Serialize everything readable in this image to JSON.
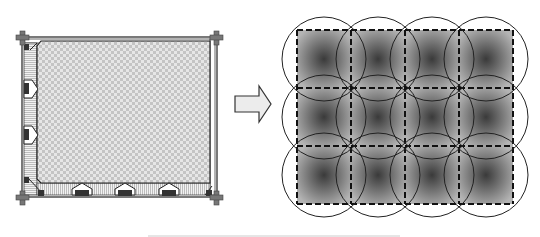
{
  "figure": {
    "left_panel": {
      "label": "room-floor-plan",
      "frame": {
        "x": 22,
        "y": 37,
        "w": 195,
        "h": 160
      },
      "floor_area": {
        "x": 37,
        "y": 41,
        "w": 176,
        "h": 142
      },
      "left_wall_windows": 2,
      "bottom_wall_windows": 3,
      "corner_posts": 4
    },
    "arrow": {
      "direction": "right",
      "x": 235,
      "y": 85,
      "w": 36,
      "h": 38
    },
    "right_panel": {
      "label": "coverage-grid",
      "grid": {
        "x": 297,
        "y": 30,
        "cols": 4,
        "rows": 3,
        "cell_w": 54,
        "cell_h": 58
      },
      "circle_radius": 42,
      "cell_count": 12
    },
    "colors": {
      "stroke": "#222222",
      "checker_light": "#e6e6e6",
      "checker_dark": "#c4c4c4",
      "gradient_center": "#3a3a3a",
      "gradient_edge": "#b4b4b4",
      "arrow_fill": "#ececec"
    }
  }
}
